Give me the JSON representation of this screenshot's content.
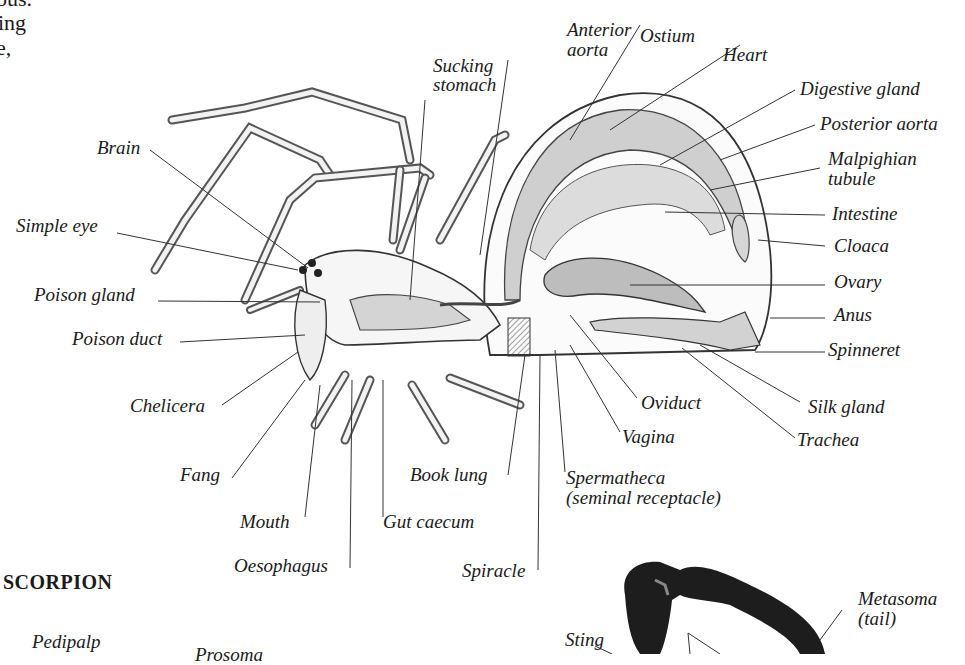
{
  "page": {
    "top_text_fragments": [
      "ous.",
      "ing",
      "e,"
    ],
    "section_heading": "SCORPION"
  },
  "spider_diagram": {
    "labels": {
      "anterior_aorta": [
        "Anterior",
        "aorta"
      ],
      "ostium": "Ostium",
      "heart": "Heart",
      "sucking_stomach": [
        "Sucking",
        "stomach"
      ],
      "digestive_gland": "Digestive gland",
      "posterior_aorta": "Posterior aorta",
      "malpighian_tubule": [
        "Malpighian",
        "tubule"
      ],
      "brain": "Brain",
      "intestine": "Intestine",
      "simple_eye": "Simple eye",
      "cloaca": "Cloaca",
      "poison_gland": "Poison gland",
      "ovary": "Ovary",
      "anus": "Anus",
      "poison_duct": "Poison duct",
      "spinneret": "Spinneret",
      "chelicera": "Chelicera",
      "oviduct": "Oviduct",
      "silk_gland": "Silk gland",
      "vagina": "Vagina",
      "trachea": "Trachea",
      "fang": "Fang",
      "book_lung": "Book lung",
      "spermatheca": [
        "Spermatheca",
        "(seminal receptacle)"
      ],
      "mouth": "Mouth",
      "gut_caecum": "Gut caecum",
      "oesophagus": "Oesophagus",
      "spiracle": "Spiracle"
    }
  },
  "scorpion_diagram": {
    "labels": {
      "pedipalp": "Pedipalp",
      "prosoma": "Prosoma",
      "sting": "Sting",
      "metasoma": [
        "Metasoma",
        "(tail)"
      ]
    }
  }
}
